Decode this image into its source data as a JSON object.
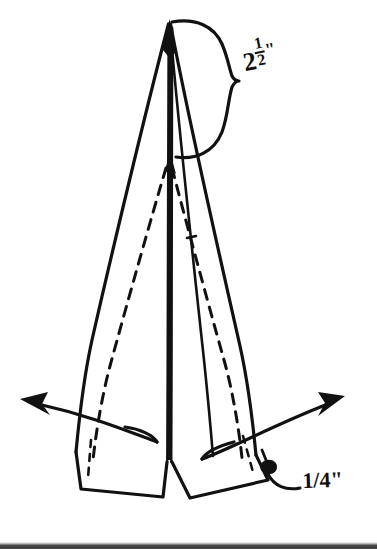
{
  "document": {
    "kind": "line-drawing-diagram",
    "subject": "paper-folding instruction figure",
    "background_color": "#ffffff",
    "ink_color": "#111111"
  },
  "annotations": {
    "top_measurement": {
      "name": "top-dimension-label",
      "whole": "2",
      "fraction_numerator": "1",
      "fraction_denominator": "2",
      "unit_mark": "\"",
      "plain_text": "2 1/2\"",
      "marker": "curly-brace",
      "marker_side": "right-of-apex"
    },
    "bottom_measurement": {
      "name": "bottom-dimension-label",
      "text": "1/4\"",
      "marker": "leader-line",
      "marker_side": "lower-right"
    }
  },
  "figure_elements": {
    "apex": "sharp-point-top-center",
    "center_spine": "vertical-double-line-crease",
    "fold_lines": "two-dashed-diagonal-creases",
    "wings": "two-bottom-flaps",
    "motion_arrows": [
      {
        "name": "left-unfold-arrow",
        "direction": "left-outward"
      },
      {
        "name": "right-unfold-arrow",
        "direction": "right-outward"
      },
      {
        "name": "center-push-arrow",
        "direction": "up-along-spine"
      }
    ]
  },
  "scan_artifact": {
    "name": "bottom-scan-band",
    "color": "#3a3a3a"
  }
}
